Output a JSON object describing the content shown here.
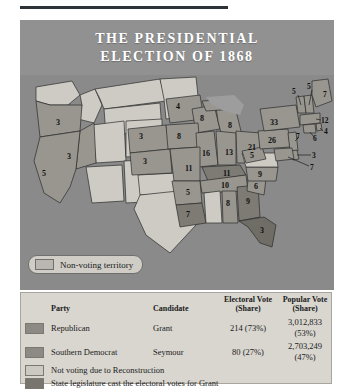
{
  "title": {
    "line1": "THE PRESIDENTIAL",
    "line2": "ELECTION OF 1868"
  },
  "map": {
    "territory_legend": {
      "swatch_name": "non-voting-territory-swatch",
      "label": "Non-voting territory"
    },
    "states": [
      {
        "name": "Oregon",
        "value": "3",
        "x": 36,
        "y": 50,
        "type": "republican"
      },
      {
        "name": "Nevada",
        "value": "3",
        "x": 47,
        "y": 84,
        "type": "republican"
      },
      {
        "name": "California",
        "value": "5",
        "x": 22,
        "y": 101,
        "type": "republican"
      },
      {
        "name": "Nebraska",
        "value": "3",
        "x": 119,
        "y": 64,
        "type": "republican"
      },
      {
        "name": "Kansas",
        "value": "3",
        "x": 123,
        "y": 89,
        "type": "republican"
      },
      {
        "name": "Minnesota",
        "value": "4",
        "x": 156,
        "y": 34,
        "type": "republican"
      },
      {
        "name": "Wisconsin",
        "value": "8",
        "x": 180,
        "y": 46,
        "type": "republican"
      },
      {
        "name": "Michigan",
        "value": "8",
        "x": 208,
        "y": 53,
        "type": "republican"
      },
      {
        "name": "Iowa",
        "value": "8",
        "x": 157,
        "y": 64,
        "type": "republican"
      },
      {
        "name": "Illinois",
        "value": "16",
        "x": 182,
        "y": 81,
        "type": "republican"
      },
      {
        "name": "Indiana",
        "value": "13",
        "x": 205,
        "y": 80,
        "type": "republican"
      },
      {
        "name": "Ohio",
        "value": "21",
        "x": 228,
        "y": 75,
        "type": "republican"
      },
      {
        "name": "Missouri",
        "value": "11",
        "x": 165,
        "y": 96,
        "type": "republican"
      },
      {
        "name": "Kentucky",
        "value": "11",
        "x": 203,
        "y": 97,
        "type": "democrat"
      },
      {
        "name": "Tennessee",
        "value": "10",
        "x": 201,
        "y": 110,
        "type": "republican"
      },
      {
        "name": "Arkansas",
        "value": "5",
        "x": 166,
        "y": 115,
        "type": "republican"
      },
      {
        "name": "Louisiana",
        "value": "7",
        "x": 172,
        "y": 139,
        "type": "democrat"
      },
      {
        "name": "Alabama",
        "value": "8",
        "x": 204,
        "y": 128,
        "type": "republican"
      },
      {
        "name": "Georgia",
        "value": "9",
        "x": 223,
        "y": 127,
        "type": "democrat"
      },
      {
        "name": "Florida",
        "value": "3",
        "x": 243,
        "y": 152,
        "type": "legislature"
      },
      {
        "name": "South Carolina",
        "value": "6",
        "x": 236,
        "y": 113,
        "type": "republican"
      },
      {
        "name": "North Carolina",
        "value": "9",
        "x": 241,
        "y": 100,
        "type": "republican"
      },
      {
        "name": "West Virginia",
        "value": "5",
        "x": 235,
        "y": 86,
        "type": "republican"
      },
      {
        "name": "Pennsylvania",
        "value": "26",
        "x": 252,
        "y": 64,
        "type": "republican"
      },
      {
        "name": "New York",
        "value": "33",
        "x": 254,
        "y": 48,
        "type": "republican"
      }
    ],
    "leader_labels": [
      {
        "name": "Vermont",
        "value": "5",
        "x": 275,
        "y": 16
      },
      {
        "name": "New Hampshire",
        "value": "5",
        "x": 290,
        "y": 11
      },
      {
        "name": "Maine",
        "value": "7",
        "x": 308,
        "y": 19
      },
      {
        "name": "Massachusetts",
        "value": "12",
        "x": 303,
        "y": 45
      },
      {
        "name": "Rhode Island",
        "value": "4",
        "x": 305,
        "y": 57
      },
      {
        "name": "Connecticut",
        "value": "6",
        "x": 295,
        "y": 64
      },
      {
        "name": "New Jersey",
        "value": "7",
        "x": 277,
        "y": 62
      },
      {
        "name": "Delaware",
        "value": "3",
        "x": 293,
        "y": 80
      },
      {
        "name": "Maryland",
        "value": "7",
        "x": 291,
        "y": 92
      }
    ]
  },
  "legend": {
    "headers": {
      "party": "Party",
      "candidate": "Candidate",
      "electoral": "Electoral Vote\n(Share)",
      "electoral_l1": "Electoral Vote",
      "electoral_l2": "(Share)",
      "popular_l1": "Popular Vote",
      "popular_l2": "(Share)"
    },
    "rows": [
      {
        "swatch": "republican-swatch",
        "party": "Republican",
        "candidate": "Grant",
        "electoral": "214 (73%)",
        "popular": "3,012,833 (53%)"
      },
      {
        "swatch": "southern-democrat-swatch",
        "party": "Southern Democrat",
        "candidate": "Seymour",
        "electoral": "80 (27%)",
        "popular": "2,703,249 (47%)"
      }
    ],
    "notes": [
      {
        "swatch": "not-voting-swatch",
        "text": "Not voting due to Reconstruction"
      },
      {
        "swatch": "legislature-swatch",
        "text": "State legislature cast the electoral votes for Grant"
      }
    ]
  },
  "colors": {
    "panel_bg": "#8e8e8e",
    "map_bg": "#8a8a8a",
    "republican": "#8c8a84",
    "non_voting": "#cbc9c2",
    "legislature": "#77756e",
    "legend_bg": "#d8d6cf"
  }
}
